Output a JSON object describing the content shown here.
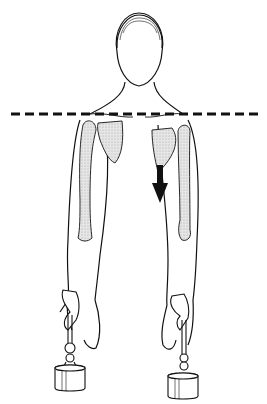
{
  "figure": {
    "elements": {
      "reference_line": "dashed horizontal shoulder-level line",
      "arrow": "downward arrow indicating scapular depression",
      "left_arm": "arm with humerus and scapula shaded, weight tied at wrist",
      "right_arm": "arm with humerus and scapula shaded, scapula depressed, weight tied at wrist"
    },
    "colors": {
      "line": "#111111",
      "bone_fill": "#d9d9d9",
      "background": "#ffffff"
    }
  }
}
